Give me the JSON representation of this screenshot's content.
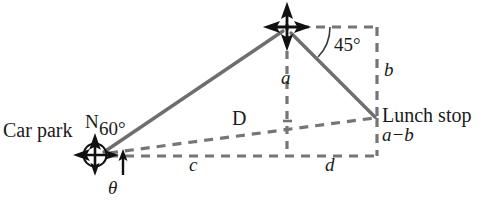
{
  "diagram": {
    "colors": {
      "line": "#757575",
      "marker": "#111111",
      "text": "#1a1a1a",
      "background": "#ffffff"
    },
    "labels": {
      "car_park": "Car park",
      "north": "N",
      "angle_60": "60°",
      "theta": "θ",
      "side_c": "c",
      "side_d": "d",
      "distance_D": "D",
      "height_a": "a",
      "height_b": "b",
      "angle_45": "45°",
      "lunch_stop": "Lunch stop",
      "lunch_stop_height": "a−b"
    },
    "points": {
      "car_park": {
        "x": 95,
        "y": 155
      },
      "apex": {
        "x": 287,
        "y": 27
      },
      "lunch_stop": {
        "x": 375,
        "y": 117
      },
      "base_right": {
        "x": 375,
        "y": 155
      },
      "apex_right": {
        "x": 375,
        "y": 27
      }
    },
    "markers": [
      {
        "name": "compass-rose-car-park",
        "x": 95,
        "y": 155,
        "radius": 14
      },
      {
        "name": "cross-marker-apex",
        "x": 287,
        "y": 27,
        "radius": 14
      }
    ],
    "solid_edges": [
      {
        "name": "car-park-to-apex",
        "from": "car_park",
        "to": "apex"
      },
      {
        "name": "apex-to-lunch-stop",
        "from": "apex",
        "to": "lunch_stop"
      }
    ],
    "dashed_edges": [
      {
        "name": "ground-line-c-d",
        "from": "car_park",
        "to": "base_right"
      },
      {
        "name": "sight-line-D",
        "from": "car_park",
        "to": "lunch_stop"
      },
      {
        "name": "vertical-a",
        "from": "apex",
        "to": "base_bottom"
      },
      {
        "name": "vertical-b",
        "from": "apex_right",
        "to": "lunch_stop"
      },
      {
        "name": "top-horizontal",
        "from": "apex",
        "to": "apex_right"
      },
      {
        "name": "vertical-a-minus-b",
        "from": "lunch_stop",
        "to": "base_right"
      }
    ]
  }
}
